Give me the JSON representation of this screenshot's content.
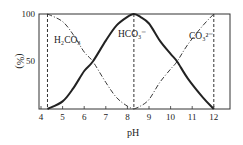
{
  "chart_data": {
    "type": "line",
    "title": "",
    "xlabel": "pH",
    "ylabel": "(%)",
    "xlim": [
      4,
      12.7
    ],
    "ylim": [
      0,
      100
    ],
    "x_ticks": [
      4,
      5,
      6,
      7,
      8,
      9,
      10,
      11,
      12
    ],
    "x_tick_labels": [
      "4",
      "5",
      "6",
      "7",
      "8",
      "9",
      "10",
      "11",
      "12"
    ],
    "y_ticks": [
      50,
      100
    ],
    "y_tick_labels": [
      "50",
      "100"
    ],
    "grid": false,
    "vertical_dashed_lines": [
      4.3,
      8.3,
      12
    ],
    "series": [
      {
        "name": "H2CO3",
        "label": "H₂CO₃",
        "style": "dash-dot",
        "x": [
          4.3,
          5,
          5.5,
          6,
          6.4,
          7,
          7.5,
          8,
          8.3
        ],
        "values": [
          100,
          92,
          78,
          60,
          50,
          28,
          12,
          3,
          0
        ]
      },
      {
        "name": "HCO3-",
        "label": "HCO₃⁻",
        "style": "solid-bold",
        "x": [
          4.3,
          5,
          5.5,
          6,
          6.4,
          7,
          7.5,
          8,
          8.3,
          8.6,
          9,
          9.5,
          10,
          10.3,
          10.8,
          11.5,
          12
        ],
        "values": [
          0,
          8,
          22,
          40,
          50,
          72,
          88,
          97,
          100,
          97,
          90,
          72,
          58,
          50,
          32,
          12,
          0
        ]
      },
      {
        "name": "CO3 2-",
        "label": "CO₃²⁻",
        "style": "dash-dot",
        "x": [
          8.3,
          8.6,
          9,
          9.5,
          10,
          10.3,
          10.8,
          11.5,
          12
        ],
        "values": [
          0,
          3,
          10,
          28,
          42,
          50,
          68,
          88,
          100
        ]
      }
    ],
    "annotations": [
      "H₂CO₃",
      "HCO₃⁻",
      "CO₃²⁻"
    ]
  },
  "labels": {
    "h2co3": "H₂CO₃",
    "hco3": "HCO₃⁻",
    "co3": "CO₃²⁻",
    "xlabel": "pH",
    "ylabel": "(%)",
    "y100": "100",
    "y50": "50"
  }
}
